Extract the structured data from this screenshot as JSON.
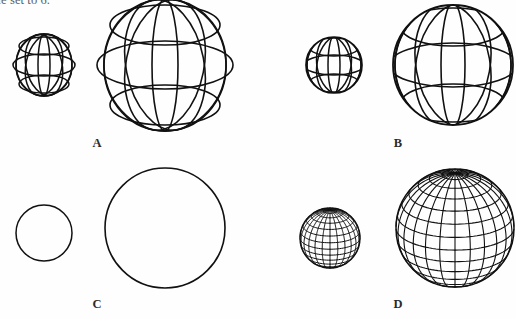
{
  "caption": {
    "partial_line": "ariable set to 6."
  },
  "figure": {
    "background_color": "#fefefe",
    "line_color": "#111111",
    "panels": [
      {
        "label": "A",
        "label_x": 97,
        "label_y": 136,
        "style": "unclipped-ellipse-wireframe",
        "description": "Wireframe sphere drawn as full latitude and longitude ellipses that extend past the silhouette",
        "meridians": 6,
        "parallels": 3,
        "small": {
          "cx": 44,
          "cy": 65,
          "r": 27
        },
        "large": {
          "cx": 165,
          "cy": 65,
          "r": 60
        }
      },
      {
        "label": "B",
        "label_x": 398,
        "label_y": 136,
        "style": "clipped-ellipse-wireframe",
        "description": "Wireframe sphere with latitude and longitude ellipses clipped to the circular silhouette",
        "meridians": 6,
        "parallels": 3,
        "small": {
          "cx": 334,
          "cy": 65,
          "r": 28
        },
        "large": {
          "cx": 453,
          "cy": 65,
          "r": 60
        }
      },
      {
        "label": "C",
        "label_x": 97,
        "label_y": 297,
        "style": "outline-only",
        "description": "Sphere rendered as a plain silhouette circle with no wireframe lines",
        "meridians": 0,
        "parallels": 0,
        "small": {
          "cx": 44,
          "cy": 233,
          "r": 28
        },
        "large": {
          "cx": 165,
          "cy": 228,
          "r": 60
        }
      },
      {
        "label": "D",
        "label_x": 398,
        "label_y": 297,
        "style": "dense-hidden-line-grid",
        "description": "High resolution latitude and longitude grid with hidden line removal, viewed slightly from above",
        "meridians": 24,
        "parallels": 14,
        "small": {
          "cx": 330,
          "cy": 238,
          "r": 30
        },
        "large": {
          "cx": 455,
          "cy": 228,
          "r": 59
        }
      }
    ]
  }
}
